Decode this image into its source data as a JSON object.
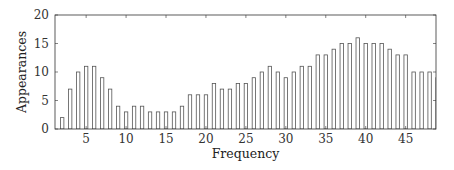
{
  "chart_data": {
    "type": "bar",
    "title": "",
    "xlabel": "Frequency",
    "ylabel": "Appearances",
    "x": [
      2,
      3,
      4,
      5,
      6,
      7,
      8,
      9,
      10,
      11,
      12,
      13,
      14,
      15,
      16,
      17,
      18,
      19,
      20,
      21,
      22,
      23,
      24,
      25,
      26,
      27,
      28,
      29,
      30,
      31,
      32,
      33,
      34,
      35,
      36,
      37,
      38,
      39,
      40,
      41,
      42,
      43,
      44,
      45,
      46,
      47,
      48,
      49
    ],
    "values": [
      2,
      7,
      10,
      11,
      11,
      9,
      7,
      4,
      3,
      4,
      4,
      3,
      3,
      3,
      3,
      4,
      6,
      6,
      6,
      8,
      7,
      7,
      8,
      8,
      9,
      10,
      11,
      10,
      9,
      10,
      11,
      11,
      13,
      13,
      14,
      15,
      15,
      16,
      15,
      15,
      15,
      14,
      13,
      13,
      10,
      10,
      10,
      9
    ],
    "xlim": [
      1.1,
      48.8
    ],
    "ylim": [
      0,
      20
    ],
    "xticks": [
      5,
      10,
      15,
      20,
      25,
      30,
      35,
      40,
      45
    ],
    "yticks": [
      0,
      5,
      10,
      15,
      20
    ],
    "grid": false,
    "legend": null,
    "bar_fill": "#ffffff",
    "bar_stroke": "#555555",
    "axis_color": "#333333"
  }
}
